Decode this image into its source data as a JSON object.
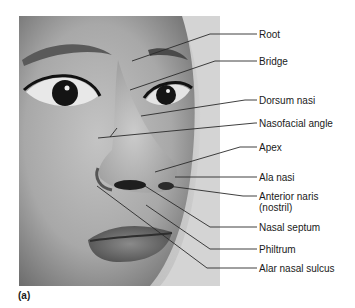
{
  "figure": {
    "panel_label": "(a)",
    "labels": [
      {
        "id": "root",
        "text": "Root",
        "text_x": 259,
        "text_y": 29,
        "points": "132,61 210,34 257,34"
      },
      {
        "id": "bridge",
        "text": "Bridge",
        "text_x": 259,
        "text_y": 56,
        "points": "130,90 215,61 257,61"
      },
      {
        "id": "dorsum-nasi",
        "text": "Dorsum nasi",
        "text_x": 259,
        "text_y": 95,
        "points": "141,116 245,100 257,100"
      },
      {
        "id": "nasofacial-angle",
        "text": "Nasofacial angle",
        "text_x": 259,
        "text_y": 118,
        "points": "98,138 255,123 257,123"
      },
      {
        "id": "apex",
        "text": "Apex",
        "text_x": 259,
        "text_y": 142,
        "points": "155,172 240,147 257,147"
      },
      {
        "id": "ala-nasi",
        "text": "Ala nasi",
        "text_x": 259,
        "text_y": 172,
        "points": "175,177 257,177"
      },
      {
        "id": "anterior-naris",
        "text": "Anterior naris",
        "text2": "(nostril)",
        "text_x": 259,
        "text_y": 191,
        "points": "168,186 243,196 257,196"
      },
      {
        "id": "nasal-septum",
        "text": "Nasal septum",
        "text_x": 259,
        "text_y": 222,
        "points": "145,186 210,227 257,227"
      },
      {
        "id": "philtrum",
        "text": "Philtrum",
        "text_x": 259,
        "text_y": 244,
        "points": "146,205 210,249 257,249"
      },
      {
        "id": "alar-nasal-sulcus",
        "text": "Alar nasal sulcus",
        "text_x": 259,
        "text_y": 263,
        "points": "97,186 207,268 257,268"
      }
    ],
    "nasofacial_tick": "110,137 117,128",
    "colors": {
      "line": "#2a2a2a",
      "text": "#1a1a1a",
      "background": "#ffffff"
    }
  }
}
